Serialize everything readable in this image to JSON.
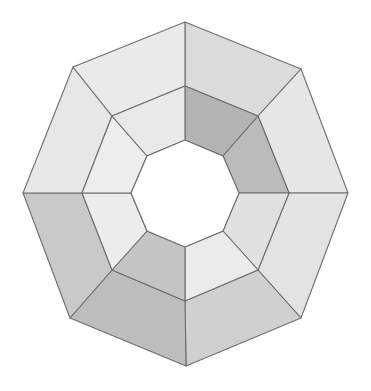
{
  "figure": {
    "name": "octagonal-ring-polyhedron",
    "canvas": {
      "width": 371,
      "height": 391,
      "background": "#ffffff"
    },
    "geometry": {
      "type": "octagonal-annulus",
      "center": {
        "x": 185,
        "y": 194
      },
      "outer_ring_sides": 8,
      "inner_hole_sides": 8,
      "face_count": 16,
      "outer_face_count": 8,
      "inner_face_count": 8,
      "rotation_degrees": 22.5,
      "outer_radius": 172,
      "mid_radius": 108,
      "inner_radius": 58
    },
    "stroke": {
      "color": "#6e6e6e",
      "width": 1.1
    },
    "palette": {
      "lightest": "#ededed",
      "light": "#e4e4e4",
      "light_mid": "#dcdcdc",
      "mid": "#cfcfcf",
      "mid_dark": "#c2c2c2",
      "dark": "#b4b4b4",
      "darkest": "#a8a8a8",
      "hole": "#ffffff",
      "outline": "#6e6e6e"
    },
    "outer_vertices": [
      {
        "index": 0,
        "label": "top",
        "x": 185,
        "y": 22
      },
      {
        "index": 1,
        "label": "top-right",
        "x": 301,
        "y": 69
      },
      {
        "index": 2,
        "label": "right",
        "x": 348,
        "y": 193
      },
      {
        "index": 3,
        "label": "bottom-right",
        "x": 301,
        "y": 318
      },
      {
        "index": 4,
        "label": "bottom",
        "x": 186,
        "y": 366
      },
      {
        "index": 5,
        "label": "bottom-left",
        "x": 70,
        "y": 318
      },
      {
        "index": 6,
        "label": "left",
        "x": 23,
        "y": 193
      },
      {
        "index": 7,
        "label": "top-left",
        "x": 73,
        "y": 67
      }
    ],
    "mid_vertices": [
      {
        "index": 0,
        "x": 185,
        "y": 86
      },
      {
        "index": 1,
        "x": 258,
        "y": 116
      },
      {
        "index": 2,
        "x": 289,
        "y": 193
      },
      {
        "index": 3,
        "x": 258,
        "y": 270
      },
      {
        "index": 4,
        "x": 185,
        "y": 301
      },
      {
        "index": 5,
        "x": 112,
        "y": 270
      },
      {
        "index": 6,
        "x": 82,
        "y": 193
      },
      {
        "index": 7,
        "x": 112,
        "y": 116
      }
    ],
    "inner_vertices": [
      {
        "index": 0,
        "x": 185,
        "y": 140
      },
      {
        "index": 1,
        "x": 223,
        "y": 156
      },
      {
        "index": 2,
        "x": 239,
        "y": 193
      },
      {
        "index": 3,
        "x": 223,
        "y": 231
      },
      {
        "index": 4,
        "x": 185,
        "y": 247
      },
      {
        "index": 5,
        "x": 147,
        "y": 231
      },
      {
        "index": 6,
        "x": 131,
        "y": 193
      },
      {
        "index": 7,
        "x": 147,
        "y": 156
      }
    ],
    "outer_faces": [
      {
        "id": "outer-face-n",
        "position": "north",
        "fill": "#dbdbdb"
      },
      {
        "id": "outer-face-ne",
        "position": "north-east",
        "fill": "#e6e6e6"
      },
      {
        "id": "outer-face-e",
        "position": "east",
        "fill": "#e3e3e3"
      },
      {
        "id": "outer-face-se",
        "position": "south-east",
        "fill": "#d0d0d0"
      },
      {
        "id": "outer-face-s",
        "position": "south",
        "fill": "#bdbdbd"
      },
      {
        "id": "outer-face-sw",
        "position": "south-west",
        "fill": "#c9c9c9"
      },
      {
        "id": "outer-face-w",
        "position": "west",
        "fill": "#e7e7e7"
      },
      {
        "id": "outer-face-nw",
        "position": "north-west",
        "fill": "#eaeaea"
      }
    ],
    "inner_faces": [
      {
        "id": "inner-face-n",
        "position": "north",
        "fill": "#b4b4b4"
      },
      {
        "id": "inner-face-ne",
        "position": "north-east",
        "fill": "#bbbbbb"
      },
      {
        "id": "inner-face-e",
        "position": "east",
        "fill": "#e1e1e1"
      },
      {
        "id": "inner-face-se",
        "position": "south-east",
        "fill": "#ebebeb"
      },
      {
        "id": "inner-face-s",
        "position": "south",
        "fill": "#c4c4c4"
      },
      {
        "id": "inner-face-sw",
        "position": "south-west",
        "fill": "#ececec"
      },
      {
        "id": "inner-face-w",
        "position": "west",
        "fill": "#ededed"
      },
      {
        "id": "inner-face-nw",
        "position": "north-west",
        "fill": "#e9e9e9"
      }
    ]
  }
}
